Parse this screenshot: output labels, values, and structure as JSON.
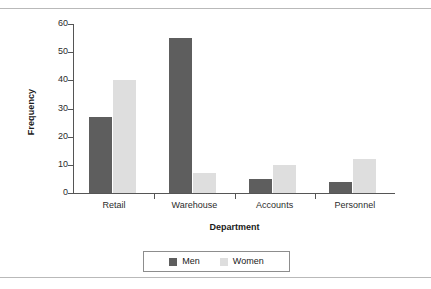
{
  "chart_data": {
    "type": "bar",
    "title": "",
    "xlabel": "Department",
    "ylabel": "Frequency",
    "categories": [
      "Retail",
      "Warehouse",
      "Accounts",
      "Personnel"
    ],
    "series": [
      {
        "name": "Men",
        "color": "#5e5e5e",
        "values": [
          27,
          55,
          5,
          4
        ]
      },
      {
        "name": "Women",
        "color": "#dedede",
        "values": [
          40,
          7,
          10,
          12
        ]
      }
    ],
    "ylim": [
      0,
      60
    ],
    "yticks": [
      0,
      10,
      20,
      30,
      40,
      50,
      60
    ],
    "ytick_labels": [
      "0",
      "10",
      "20",
      "30",
      "40",
      "50",
      "60"
    ],
    "grid": false,
    "legend_position": "bottom",
    "legend_entries": [
      "Men",
      "Women"
    ]
  },
  "figure": {
    "background": "#ffffff",
    "axis_color": "#555555",
    "rule_color": "#b9b9b9"
  }
}
